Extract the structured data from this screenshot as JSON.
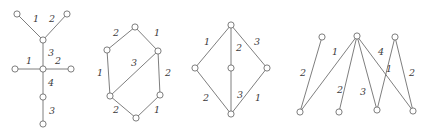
{
  "figure": {
    "background_color": "#ffffff",
    "stroke_color": "#6f6f6f",
    "label_color": "#3b3b3b",
    "node_radius": 3.1,
    "width": 432,
    "height": 131
  },
  "graphs": [
    {
      "id": "graph-1",
      "name": "star-tree-graph",
      "nodes": [
        {
          "id": "g1n1",
          "x": 17,
          "y": 14
        },
        {
          "id": "g1n2",
          "x": 67,
          "y": 14
        },
        {
          "id": "g1n3",
          "x": 43,
          "y": 40
        },
        {
          "id": "g1n4",
          "x": 15,
          "y": 69
        },
        {
          "id": "g1n5",
          "x": 43,
          "y": 69
        },
        {
          "id": "g1n6",
          "x": 71,
          "y": 69
        },
        {
          "id": "g1n7",
          "x": 43,
          "y": 97
        },
        {
          "id": "g1n8",
          "x": 43,
          "y": 124
        }
      ],
      "edges": [
        {
          "from": "g1n1",
          "to": "g1n3",
          "label": "1",
          "lx": 36,
          "ly": 19
        },
        {
          "from": "g1n2",
          "to": "g1n3",
          "label": "2",
          "lx": 52,
          "ly": 19
        },
        {
          "from": "g1n3",
          "to": "g1n5",
          "label": "3",
          "lx": 51,
          "ly": 53
        },
        {
          "from": "g1n4",
          "to": "g1n5",
          "label": "1",
          "lx": 29,
          "ly": 61
        },
        {
          "from": "g1n5",
          "to": "g1n6",
          "label": "2",
          "lx": 58,
          "ly": 61
        },
        {
          "from": "g1n5",
          "to": "g1n7",
          "label": "4",
          "lx": 51,
          "ly": 83
        },
        {
          "from": "g1n7",
          "to": "g1n8",
          "label": "3",
          "lx": 52,
          "ly": 111
        }
      ]
    },
    {
      "id": "graph-2",
      "name": "hexagon-chord-graph",
      "nodes": [
        {
          "id": "g2n1",
          "x": 135,
          "y": 27
        },
        {
          "id": "g2n2",
          "x": 107,
          "y": 50
        },
        {
          "id": "g2n3",
          "x": 158,
          "y": 51
        },
        {
          "id": "g2n4",
          "x": 110,
          "y": 96
        },
        {
          "id": "g2n5",
          "x": 160,
          "y": 95
        },
        {
          "id": "g2n6",
          "x": 136,
          "y": 118
        }
      ],
      "edges": [
        {
          "from": "g2n2",
          "to": "g2n1",
          "label": "2",
          "lx": 116,
          "ly": 33
        },
        {
          "from": "g2n1",
          "to": "g2n3",
          "label": "1",
          "lx": 157,
          "ly": 33
        },
        {
          "from": "g2n2",
          "to": "g2n4",
          "label": "1",
          "lx": 100,
          "ly": 73
        },
        {
          "from": "g2n3",
          "to": "g2n4",
          "label": "3",
          "lx": 134,
          "ly": 63
        },
        {
          "from": "g2n3",
          "to": "g2n5",
          "label": "2",
          "lx": 168,
          "ly": 73
        },
        {
          "from": "g2n4",
          "to": "g2n6",
          "label": "2",
          "lx": 116,
          "ly": 110
        },
        {
          "from": "g2n5",
          "to": "g2n6",
          "label": "1",
          "lx": 157,
          "ly": 110
        }
      ]
    },
    {
      "id": "graph-3",
      "name": "diamond-with-spine-graph",
      "nodes": [
        {
          "id": "g3n1",
          "x": 231,
          "y": 25
        },
        {
          "id": "g3n2",
          "x": 195,
          "y": 68
        },
        {
          "id": "g3n3",
          "x": 231,
          "y": 68
        },
        {
          "id": "g3n4",
          "x": 267,
          "y": 68
        },
        {
          "id": "g3n5",
          "x": 231,
          "y": 114
        }
      ],
      "edges": [
        {
          "from": "g3n1",
          "to": "g3n2",
          "label": "1",
          "lx": 207,
          "ly": 42
        },
        {
          "from": "g3n1",
          "to": "g3n3",
          "label": "2",
          "lx": 239,
          "ly": 48
        },
        {
          "from": "g3n1",
          "to": "g3n4",
          "label": "3",
          "lx": 257,
          "ly": 42
        },
        {
          "from": "g3n2",
          "to": "g3n5",
          "label": "2",
          "lx": 206,
          "ly": 98
        },
        {
          "from": "g3n3",
          "to": "g3n5",
          "label": "3",
          "lx": 240,
          "ly": 95
        },
        {
          "from": "g3n4",
          "to": "g3n5",
          "label": "1",
          "lx": 258,
          "ly": 98
        }
      ]
    },
    {
      "id": "graph-4",
      "name": "zigzag-bipartite-graph",
      "nodes": [
        {
          "id": "g4n1",
          "x": 322,
          "y": 37
        },
        {
          "id": "g4n2",
          "x": 357,
          "y": 36
        },
        {
          "id": "g4n3",
          "x": 395,
          "y": 37
        },
        {
          "id": "g4n4",
          "x": 300,
          "y": 112
        },
        {
          "id": "g4n5",
          "x": 339,
          "y": 112
        },
        {
          "id": "g4n6",
          "x": 377,
          "y": 110
        },
        {
          "id": "g4n7",
          "x": 413,
          "y": 111
        }
      ],
      "edges": [
        {
          "from": "g4n1",
          "to": "g4n4",
          "label": "2",
          "lx": 303,
          "ly": 73
        },
        {
          "from": "g4n2",
          "to": "g4n4",
          "label": "1",
          "lx": 335,
          "ly": 52
        },
        {
          "from": "g4n2",
          "to": "g4n5",
          "label": "2",
          "lx": 340,
          "ly": 90
        },
        {
          "from": "g4n2",
          "to": "g4n6",
          "label": "3",
          "lx": 363,
          "ly": 92
        },
        {
          "from": "g4n2",
          "to": "g4n7",
          "label": "4",
          "lx": 381,
          "ly": 52
        },
        {
          "from": "g4n3",
          "to": "g4n6",
          "label": "1",
          "lx": 389,
          "ly": 69
        },
        {
          "from": "g4n3",
          "to": "g4n7",
          "label": "2",
          "lx": 412,
          "ly": 73
        }
      ]
    }
  ]
}
